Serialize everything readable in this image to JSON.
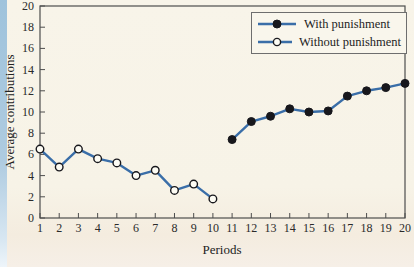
{
  "figure": {
    "ylabel": "Average contributions",
    "xlabel": "Periods"
  },
  "legend": {
    "items": [
      {
        "label": "With punishment",
        "marker": "filled-circle"
      },
      {
        "label": "Without punishment",
        "marker": "open-circle"
      }
    ]
  },
  "colors": {
    "line": "#3a6ea8",
    "marker_dark": "#17171c",
    "marker_open_fill": "#fdfcf4",
    "axis": "#4d4d4d",
    "text": "#2a2a2a",
    "background": "#f8f4e9",
    "edge_strip": "#a9c8de",
    "legend_background": "#f9f6ec"
  },
  "chart_data": {
    "type": "line",
    "title": "",
    "xlabel": "Periods",
    "ylabel": "Average contributions",
    "xlim": [
      1,
      20
    ],
    "ylim": [
      0,
      20
    ],
    "x_ticks": [
      1,
      2,
      3,
      4,
      5,
      6,
      7,
      8,
      9,
      10,
      11,
      12,
      13,
      14,
      15,
      16,
      17,
      18,
      19,
      20
    ],
    "y_ticks": [
      0,
      2,
      4,
      6,
      8,
      10,
      12,
      14,
      16,
      18,
      20
    ],
    "grid": false,
    "frame": "box",
    "legend_position": "top-right",
    "series": [
      {
        "name": "Without punishment",
        "marker": "open-circle",
        "x": [
          1,
          2,
          3,
          4,
          5,
          6,
          7,
          8,
          9,
          10
        ],
        "values": [
          6.5,
          4.8,
          6.5,
          5.6,
          5.2,
          4.0,
          4.5,
          2.6,
          3.2,
          1.8
        ]
      },
      {
        "name": "With punishment",
        "marker": "filled-circle",
        "x": [
          11,
          12,
          13,
          14,
          15,
          16,
          17,
          18,
          19,
          20
        ],
        "values": [
          7.4,
          9.1,
          9.6,
          10.3,
          10.0,
          10.1,
          11.5,
          12.0,
          12.3,
          12.7
        ]
      }
    ]
  }
}
